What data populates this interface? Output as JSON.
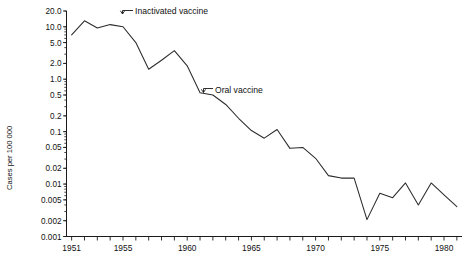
{
  "chart_data": {
    "type": "line",
    "title": "",
    "xlabel": "",
    "ylabel": "Cases per 100 000",
    "yscale": "log",
    "ylim": [
      0.001,
      20.0
    ],
    "xlim": [
      1950.6,
      1981.4
    ],
    "grid": false,
    "legend": "none",
    "ytick_labels": [
      "20.0",
      "10.0",
      "5.0",
      "2.0",
      "1.0",
      "0.5",
      "0.2",
      "0.1",
      "0.05",
      "0.02",
      "0.01",
      "0.005",
      "0.002",
      "0.001"
    ],
    "ytick_values": [
      20.0,
      10.0,
      5.0,
      2.0,
      1.0,
      0.5,
      0.2,
      0.1,
      0.05,
      0.02,
      0.01,
      0.005,
      0.002,
      0.001
    ],
    "xtick_labels": [
      "1951",
      "1955",
      "1960",
      "1965",
      "1970",
      "1975",
      "1980"
    ],
    "xtick_values": [
      1951,
      1955,
      1960,
      1965,
      1970,
      1975,
      1980
    ],
    "x": [
      1951,
      1952,
      1953,
      1954,
      1955,
      1956,
      1957,
      1958,
      1959,
      1960,
      1961,
      1962,
      1963,
      1964,
      1965,
      1966,
      1967,
      1968,
      1969,
      1970,
      1971,
      1972,
      1973,
      1974,
      1975,
      1976,
      1977,
      1978,
      1979,
      1980,
      1981
    ],
    "values": [
      7.0,
      13.0,
      9.5,
      11.0,
      10.0,
      5.0,
      1.55,
      2.3,
      3.5,
      1.8,
      0.55,
      0.5,
      0.33,
      0.18,
      0.105,
      0.075,
      0.11,
      0.048,
      0.05,
      0.031,
      0.0145,
      0.013,
      0.013,
      0.0021,
      0.0067,
      0.0055,
      0.0105,
      0.004,
      0.0105,
      0.0062,
      0.0037
    ],
    "series": [
      {
        "name": "Poliomyelitis cases per 100 000",
        "values": [
          7.0,
          13.0,
          9.5,
          11.0,
          10.0,
          5.0,
          1.55,
          2.3,
          3.5,
          1.8,
          0.55,
          0.5,
          0.33,
          0.18,
          0.105,
          0.075,
          0.11,
          0.048,
          0.05,
          0.031,
          0.0145,
          0.013,
          0.013,
          0.0021,
          0.0067,
          0.0055,
          0.0105,
          0.004,
          0.0105,
          0.0062,
          0.0037
        ]
      }
    ],
    "annotations": [
      {
        "label": "Inactivated vaccine",
        "x": 1955,
        "text_x": 1955.6,
        "text_y": 14.0
      },
      {
        "label": "Oral vaccine",
        "x": 1961.8,
        "text_x": 1962.7,
        "text_y": 0.86
      }
    ]
  },
  "axis": {
    "y_title": "Cases per 100 000"
  },
  "annotations": {
    "inactivated": "Inactivated vaccine",
    "oral": "Oral vaccine"
  },
  "ticks": {
    "y": [
      {
        "label": "20.0"
      },
      {
        "label": "10.0"
      },
      {
        "label": "5.0"
      },
      {
        "label": "2.0"
      },
      {
        "label": "1.0"
      },
      {
        "label": "0.5"
      },
      {
        "label": "0.2"
      },
      {
        "label": "0.1"
      },
      {
        "label": "0.05"
      },
      {
        "label": "0.02"
      },
      {
        "label": "0.01"
      },
      {
        "label": "0.005"
      },
      {
        "label": "0.002"
      },
      {
        "label": "0.001"
      }
    ],
    "x": [
      {
        "label": "1951"
      },
      {
        "label": "1955"
      },
      {
        "label": "1960"
      },
      {
        "label": "1965"
      },
      {
        "label": "1970"
      },
      {
        "label": "1975"
      },
      {
        "label": "1980"
      }
    ]
  },
  "colors": {
    "line": "#2b2b2b",
    "axis": "#1a1a1a",
    "text": "#111111",
    "background": "#ffffff"
  }
}
